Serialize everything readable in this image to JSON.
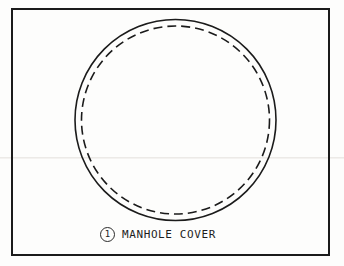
{
  "sheet": {
    "title": "Manhole Cover Detail",
    "background_color": "#fdfdfc",
    "ink_color": "#1b1b1b"
  },
  "frame": {
    "name": "drawing-border",
    "stroke_color": "#1b1b1b"
  },
  "drawing": {
    "subject": "manhole cover",
    "shapes": [
      {
        "name": "cover-outline",
        "type": "circle",
        "style": "solid",
        "center_x": 175.5,
        "center_y": 120,
        "radius": 100.5,
        "stroke_color": "#1b1b1b",
        "stroke_width": 1.6
      },
      {
        "name": "cover-inner-hidden-edge",
        "type": "circle",
        "style": "dashed",
        "center_x": 175.5,
        "center_y": 120,
        "radius": 94,
        "stroke_color": "#1b1b1b",
        "stroke_width": 1.6,
        "dash_length": 9,
        "dash_gap": 5
      }
    ]
  },
  "callout": {
    "number": "1",
    "label": "MANHOLE COVER",
    "bubble_shape": "circle"
  }
}
